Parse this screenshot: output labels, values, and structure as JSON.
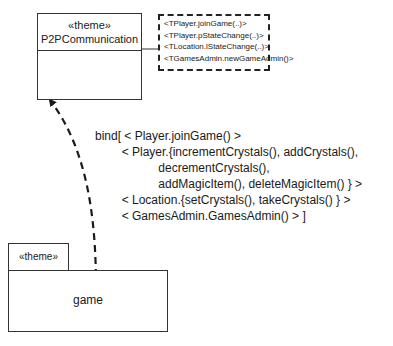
{
  "diagram": {
    "type": "UML theme binding diagram",
    "top_theme": {
      "stereotype": "«theme»",
      "name": "P2PCommunication",
      "template_parameters": [
        "<TPlayer.joinGame(..)>",
        "<TPlayer.pStateChange(..)>",
        "<TLocation.lStateChange(..)>",
        "<TGamesAdmin.newGameAdmin()>"
      ]
    },
    "bottom_theme": {
      "stereotype": "«theme»",
      "name": "game"
    },
    "binding": {
      "lines": [
        "bind[ < Player.joinGame() >",
        "        < Player.{incrementCrystals(), addCrystals(),",
        "                   decrementCrystals(),",
        "                   addMagicItem(), deleteMagicItem() } >",
        "        < Location.{setCrystals(), takeCrystals() } >",
        "        < GamesAdmin.GamesAdmin() > ]"
      ]
    },
    "colors": {
      "line": "#333333",
      "background": "#ffffff",
      "text": "#1a1a1a"
    }
  }
}
